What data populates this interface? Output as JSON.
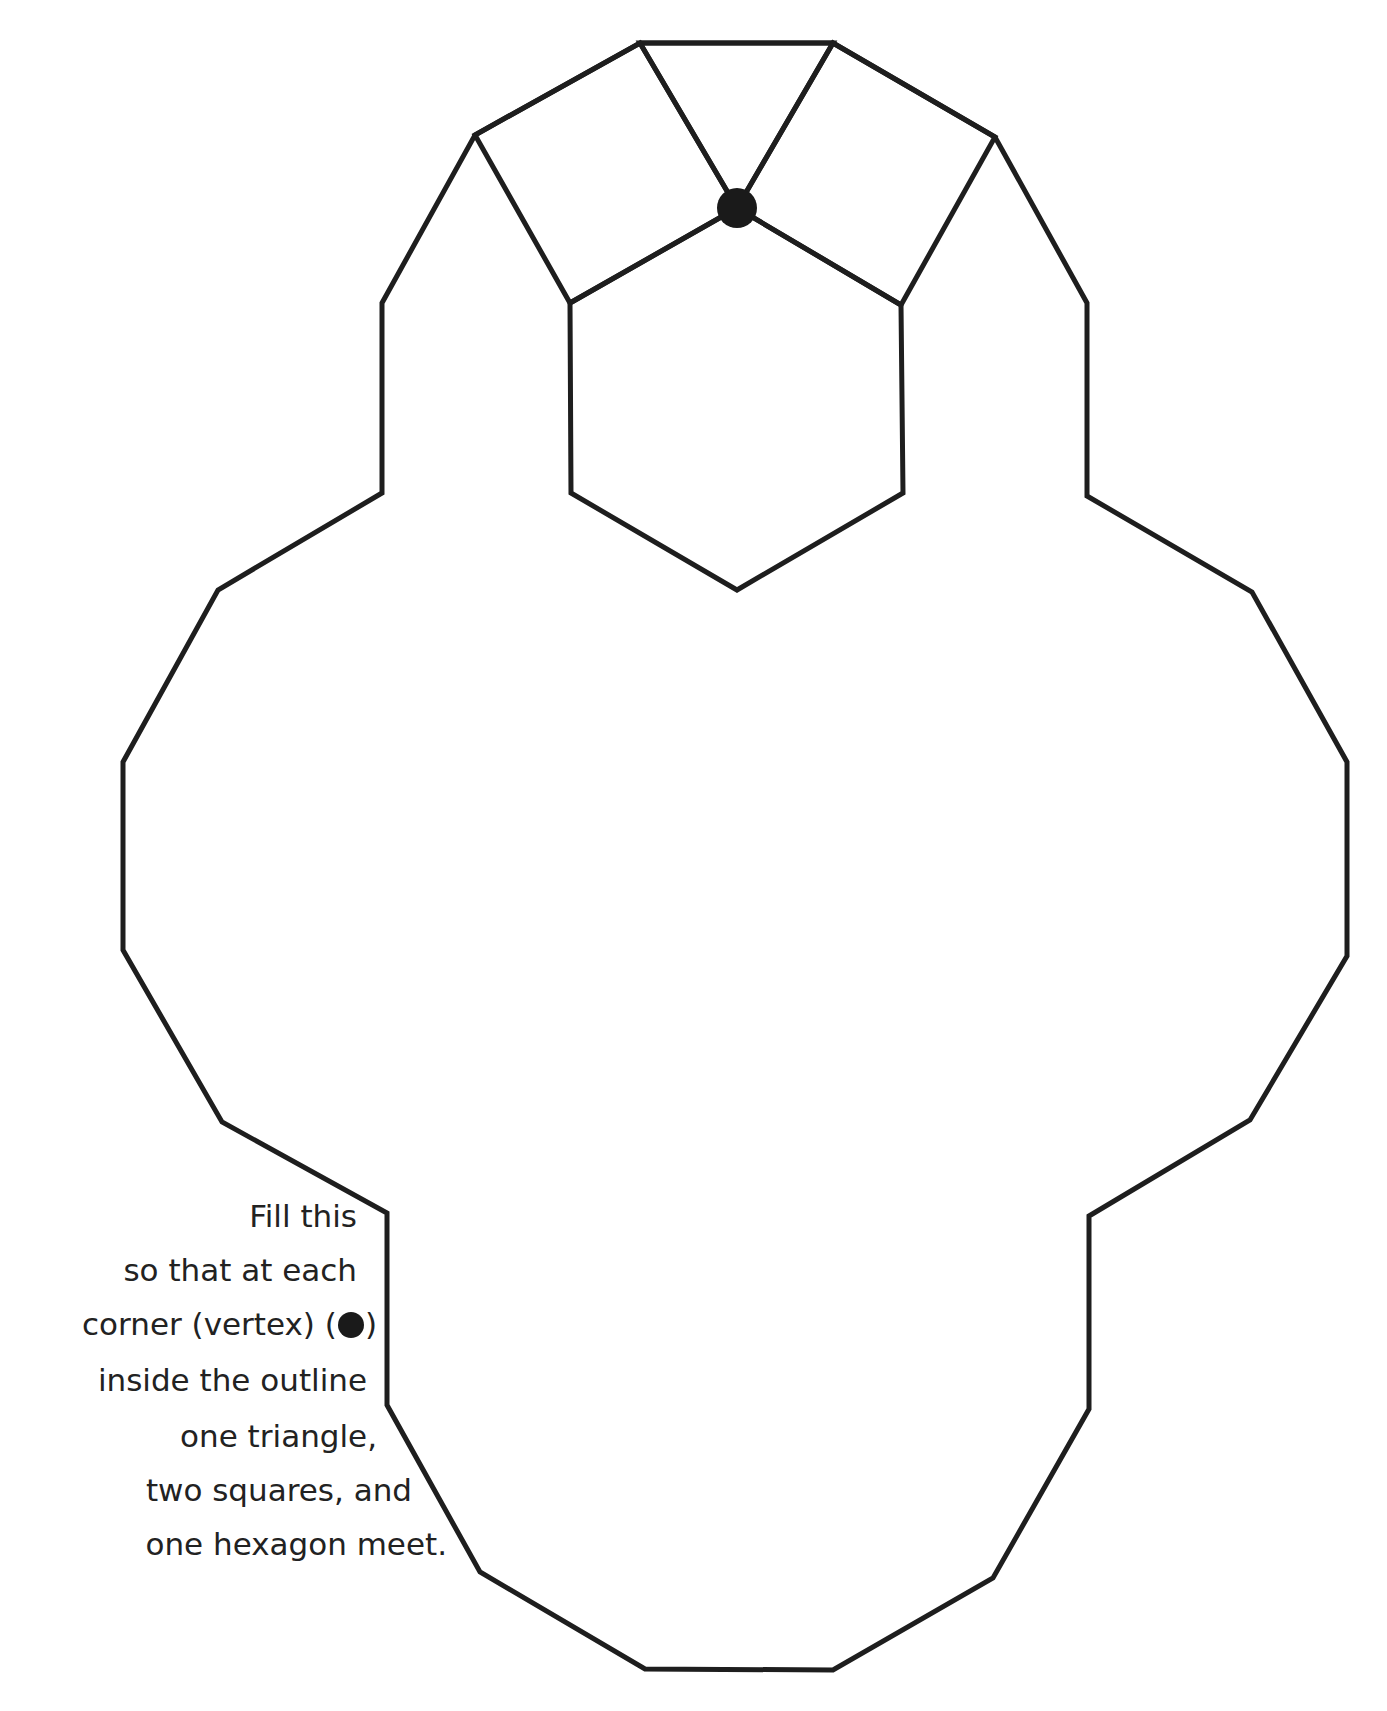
{
  "figure": {
    "stroke_color": "#1e1e1e",
    "background": "#ffffff",
    "outline_vertices": [
      [
        640,
        43
      ],
      [
        833,
        43
      ],
      [
        995,
        137
      ],
      [
        1087,
        303
      ],
      [
        1087,
        496
      ],
      [
        1252,
        592
      ],
      [
        1347,
        762
      ],
      [
        1347,
        956
      ],
      [
        1250,
        1120
      ],
      [
        1089,
        1216
      ],
      [
        1089,
        1409
      ],
      [
        993,
        1578
      ],
      [
        833,
        1670
      ],
      [
        645,
        1669
      ],
      [
        480,
        1572
      ],
      [
        387,
        1405
      ],
      [
        387,
        1213
      ],
      [
        222,
        1122
      ],
      [
        123,
        950
      ],
      [
        123,
        762
      ],
      [
        218,
        590
      ],
      [
        382,
        493
      ],
      [
        382,
        303
      ],
      [
        475,
        135
      ]
    ],
    "prefilled_shapes": {
      "triangle": [
        [
          640,
          43
        ],
        [
          833,
          43
        ],
        [
          737,
          208
        ]
      ],
      "left_square": [
        [
          475,
          135
        ],
        [
          640,
          43
        ],
        [
          737,
          208
        ],
        [
          570,
          303
        ]
      ],
      "right_square": [
        [
          833,
          43
        ],
        [
          995,
          137
        ],
        [
          901,
          305
        ],
        [
          737,
          208
        ]
      ],
      "hexagon": [
        [
          570,
          303
        ],
        [
          737,
          208
        ],
        [
          901,
          305
        ],
        [
          903,
          493
        ],
        [
          737,
          590
        ],
        [
          571,
          493
        ]
      ]
    },
    "example_vertex": {
      "x": 737,
      "y": 208,
      "r": 20,
      "icon": "filled-circle-icon"
    }
  },
  "instructions": {
    "lines": [
      "Fill this",
      "so that at each",
      "corner (vertex) (",
      "inside the outline",
      "one triangle,",
      "two squares, and",
      "one hexagon meet."
    ],
    "vertex_symbol_close": ")"
  }
}
